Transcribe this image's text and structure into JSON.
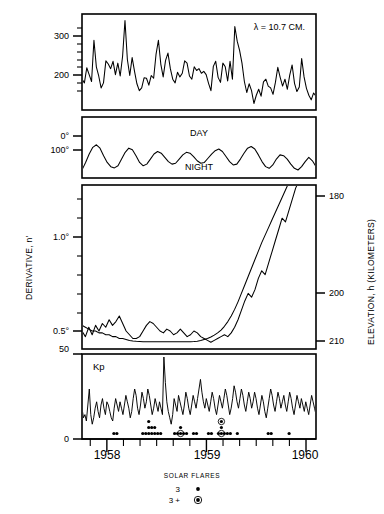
{
  "figure": {
    "background": "#ffffff",
    "ink": "#000000",
    "width": 384,
    "height": 514
  },
  "chart_data": {
    "type": "line",
    "title": "",
    "xlabel": "",
    "ylabel": "",
    "grid": false,
    "legend_position": "bottom-center",
    "x": {
      "axis_label": "",
      "tick_labels": [
        "1958",
        "1959",
        "1960"
      ],
      "tick_positions": [
        1958.0,
        1959.0,
        1960.0
      ],
      "range": [
        1957.75,
        1960.1
      ],
      "minor_tick_interval_months": 2
    },
    "panels": [
      {
        "name": "solar-flux-panel",
        "annotation": "λ = 10.7 CM.",
        "ylabel": "",
        "y_tick_labels": [
          "300",
          "200"
        ],
        "y_tick_values": [
          300,
          200
        ],
        "ylim": [
          140,
          345
        ],
        "series": [
          {
            "name": "10.7 cm solar radio flux",
            "values": [
              205,
              197,
              230,
              215,
              200,
              290,
              232,
              212,
              186,
              197,
              245,
              238,
              228,
              244,
              215,
              240,
              212,
              255,
              333,
              248,
              213,
              252,
              222,
              195,
              180,
              186,
              208,
              207,
              192,
              213,
              207,
              259,
              290,
              238,
              210,
              246,
              262,
              228,
              205,
              197,
              220,
              210,
              218,
              245,
              240,
              212,
              205,
              232,
              224,
              228,
              218,
              222,
              215,
              196,
              180,
              233,
              244,
              209,
              198,
              240,
              232,
              201,
              244,
              205,
              320,
              288,
              268,
              240,
              200,
              176,
              195,
              180,
              152,
              170,
              183,
              168,
              199,
              205,
              190,
              186,
              172,
              198,
              231,
              209,
              190,
              205,
              183,
              214,
              236,
              196,
              178,
              188,
              250,
              210,
              185,
              170,
              160,
              175,
              168
            ]
          }
        ]
      },
      {
        "name": "day-night-panel",
        "ylabel": "",
        "y_tick_labels": [
          "0°",
          "100°"
        ],
        "y_tick_values": [
          0,
          100
        ],
        "in_plot_labels": [
          "DAY",
          "NIGHT"
        ],
        "series": [
          {
            "name": "perigee solar angle (day/night cycle)",
            "values": [
              100,
              82,
              62,
              46,
              40,
              48,
              66,
              82,
              92,
              95,
              90,
              74,
              58,
              48,
              52,
              66,
              82,
              90,
              86,
              74,
              62,
              56,
              60,
              70,
              80,
              86,
              84,
              74,
              64,
              58,
              60,
              68,
              78,
              84,
              82,
              72,
              62,
              54,
              50,
              56,
              68,
              80,
              88,
              86,
              74,
              60,
              48,
              44,
              50,
              64,
              80,
              92,
              96,
              88,
              74,
              64,
              66,
              74,
              86,
              96,
              100,
              92,
              80,
              70,
              78,
              92
            ]
          }
        ]
      },
      {
        "name": "derivative-elevation-panel",
        "ylabel_left": "DERIVATIVE, n'",
        "ylabel_right": "ELEVATION, h (KILOMETERS)",
        "y_tick_labels_left": [
          "1.0°",
          "0.5°",
          "50"
        ],
        "y_tick_values_left": [
          1.0,
          0.5
        ],
        "y_tick_labels_right": [
          "180",
          "200",
          "210"
        ],
        "y_tick_values_right": [
          180,
          200,
          210
        ],
        "right_axis_inverted": true,
        "series": [
          {
            "name": "observed derivative",
            "values": [
              0.5,
              0.47,
              0.52,
              0.48,
              0.53,
              0.5,
              0.54,
              0.52,
              0.56,
              0.53,
              0.55,
              0.58,
              0.54,
              0.5,
              0.48,
              0.46,
              0.46,
              0.47,
              0.5,
              0.53,
              0.55,
              0.54,
              0.52,
              0.5,
              0.49,
              0.51,
              0.5,
              0.48,
              0.49,
              0.51,
              0.49,
              0.47,
              0.48,
              0.5,
              0.49,
              0.47,
              0.46,
              0.45,
              0.44,
              0.45,
              0.46,
              0.47,
              0.48,
              0.47,
              0.49,
              0.52,
              0.56,
              0.61,
              0.66,
              0.7,
              0.68,
              0.72,
              0.78,
              0.82,
              0.8,
              0.86,
              0.92,
              0.98,
              1.04,
              1.1,
              1.08,
              1.14,
              1.2,
              1.26,
              1.3,
              1.34,
              1.38,
              1.4,
              1.43,
              1.45
            ]
          },
          {
            "name": "smoothed model curve",
            "values": [
              0.53,
              0.52,
              0.51,
              0.5,
              0.5,
              0.49,
              0.49,
              0.48,
              0.48,
              0.47,
              0.47,
              0.46,
              0.46,
              0.455,
              0.45,
              0.447,
              0.445,
              0.444,
              0.443,
              0.443,
              0.443,
              0.443,
              0.443,
              0.443,
              0.443,
              0.443,
              0.443,
              0.443,
              0.443,
              0.443,
              0.443,
              0.443,
              0.443,
              0.444,
              0.446,
              0.45,
              0.455,
              0.46,
              0.468,
              0.478,
              0.49,
              0.505,
              0.525,
              0.55,
              0.58,
              0.615,
              0.655,
              0.7,
              0.745,
              0.79,
              0.835,
              0.88,
              0.925,
              0.97,
              1.01,
              1.05,
              1.09,
              1.13,
              1.17,
              1.21,
              1.25,
              1.29,
              1.33,
              1.37,
              1.4,
              1.43,
              1.45,
              1.46,
              1.47,
              1.47
            ]
          }
        ]
      },
      {
        "name": "kp-panel",
        "annotation": "Kp",
        "y_tick_labels": [
          "50",
          "0"
        ],
        "y_tick_values": [
          50,
          0
        ],
        "ylim": [
          0,
          50
        ],
        "series": [
          {
            "name": "Kp geomagnetic index",
            "values": [
              18,
              12,
              14,
              10,
              20,
              30,
              14,
              8,
              12,
              18,
              22,
              16,
              12,
              20,
              24,
              18,
              14,
              22,
              20,
              16,
              12,
              10,
              18,
              24,
              20,
              16,
              22,
              18,
              14,
              20,
              26,
              22,
              18,
              12,
              16,
              24,
              30,
              26,
              18,
              14,
              20,
              28,
              24,
              18,
              22,
              30,
              26,
              20,
              14,
              18,
              24,
              20,
              16,
              22,
              18,
              14,
              50,
              34,
              22,
              16,
              12,
              8,
              14,
              24,
              20,
              16,
              26,
              22,
              18,
              14,
              20,
              28,
              24,
              18,
              14,
              20,
              26,
              22,
              18,
              24,
              30,
              36,
              28,
              22,
              18,
              24,
              20,
              16,
              22,
              28,
              24,
              18,
              14,
              20,
              26,
              22,
              18,
              24,
              30,
              26,
              20,
              14,
              18,
              24,
              32,
              28,
              22,
              18,
              24,
              30,
              26,
              20,
              16,
              22,
              28,
              24,
              18,
              22,
              28,
              24,
              18,
              14,
              20,
              26,
              22,
              16,
              12,
              18,
              24,
              30,
              26,
              20,
              16,
              22,
              28,
              24,
              18,
              22,
              26,
              20,
              16,
              22,
              28,
              24,
              18,
              14,
              20,
              26,
              22,
              18,
              24,
              20,
              16,
              22,
              18,
              14,
              20,
              26,
              22,
              18,
              14
            ]
          }
        ]
      }
    ],
    "solar_flares": {
      "legend_title": "SOLAR FLARES",
      "classes": [
        {
          "label": "3",
          "marker": "dot"
        },
        {
          "label": "3 +",
          "marker": "circled-dot"
        }
      ],
      "events": [
        {
          "x": 1958.07,
          "row": 0,
          "marker": "dot"
        },
        {
          "x": 1958.1,
          "row": 0,
          "marker": "dot"
        },
        {
          "x": 1958.36,
          "row": 0,
          "marker": "dot"
        },
        {
          "x": 1958.39,
          "row": 0,
          "marker": "dot"
        },
        {
          "x": 1958.42,
          "row": 0,
          "marker": "dot"
        },
        {
          "x": 1958.42,
          "row": 1,
          "marker": "dot"
        },
        {
          "x": 1958.42,
          "row": 2,
          "marker": "dot"
        },
        {
          "x": 1958.45,
          "row": 0,
          "marker": "dot"
        },
        {
          "x": 1958.45,
          "row": 1,
          "marker": "dot"
        },
        {
          "x": 1958.48,
          "row": 0,
          "marker": "dot"
        },
        {
          "x": 1958.48,
          "row": 1,
          "marker": "dot"
        },
        {
          "x": 1958.51,
          "row": 0,
          "marker": "dot"
        },
        {
          "x": 1958.54,
          "row": 0,
          "marker": "dot"
        },
        {
          "x": 1958.68,
          "row": 0,
          "marker": "dot"
        },
        {
          "x": 1958.71,
          "row": 0,
          "marker": "dot"
        },
        {
          "x": 1958.74,
          "row": 0,
          "marker": "circled-dot"
        },
        {
          "x": 1958.74,
          "row": 1,
          "marker": "dot"
        },
        {
          "x": 1958.77,
          "row": 0,
          "marker": "dot"
        },
        {
          "x": 1958.8,
          "row": 0,
          "marker": "dot"
        },
        {
          "x": 1958.87,
          "row": 0,
          "marker": "dot"
        },
        {
          "x": 1958.9,
          "row": 0,
          "marker": "dot"
        },
        {
          "x": 1959.02,
          "row": 0,
          "marker": "dot"
        },
        {
          "x": 1959.05,
          "row": 0,
          "marker": "dot"
        },
        {
          "x": 1959.12,
          "row": 0,
          "marker": "dot"
        },
        {
          "x": 1959.15,
          "row": 0,
          "marker": "circled-dot"
        },
        {
          "x": 1959.15,
          "row": 1,
          "marker": "dot"
        },
        {
          "x": 1959.15,
          "row": 2,
          "marker": "circled-dot"
        },
        {
          "x": 1959.18,
          "row": 0,
          "marker": "dot"
        },
        {
          "x": 1959.21,
          "row": 0,
          "marker": "dot"
        },
        {
          "x": 1959.24,
          "row": 0,
          "marker": "dot"
        },
        {
          "x": 1959.31,
          "row": 0,
          "marker": "dot"
        },
        {
          "x": 1959.62,
          "row": 0,
          "marker": "dot"
        },
        {
          "x": 1959.65,
          "row": 0,
          "marker": "dot"
        },
        {
          "x": 1959.83,
          "row": 0,
          "marker": "dot"
        }
      ]
    }
  }
}
